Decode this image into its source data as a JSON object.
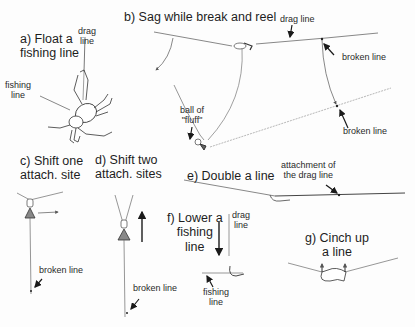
{
  "panels": {
    "a": {
      "title_line1": "a) Float a",
      "title_line2": "fishing line",
      "labels": {
        "drag_line_1": "drag",
        "drag_line_2": "line",
        "fishing_line_1": "fishing",
        "fishing_line_2": "line"
      }
    },
    "b": {
      "title": "b) Sag while break and reel",
      "labels": {
        "drag_line": "drag line",
        "broken_line_upper": "broken line",
        "broken_line_lower": "broken line",
        "ball_of_fluff_1": "ball of",
        "ball_of_fluff_2": "\"fluff\""
      }
    },
    "c": {
      "title_line1": "c) Shift one",
      "title_line2": "attach. site",
      "labels": {
        "broken_line": "broken line"
      }
    },
    "d": {
      "title_line1": "d) Shift two",
      "title_line2": "attach. sites",
      "labels": {
        "broken_line": "broken line"
      }
    },
    "e": {
      "title": "e) Double a line",
      "labels": {
        "attachment_1": "attachment of",
        "attachment_2": "the drag line"
      }
    },
    "f": {
      "title_line1": "f) Lower a",
      "title_line2": "fishing",
      "title_line3": "line",
      "labels": {
        "drag_line_1": "drag",
        "drag_line_2": "line",
        "fishing_line_1": "fishing",
        "fishing_line_2": "line"
      }
    },
    "g": {
      "title_line1": "g) Cinch up",
      "title_line2": "a line"
    }
  },
  "colors": {
    "line": "#6a6a6a",
    "ink": "#1a1a1a",
    "background": "#fdfdfd"
  }
}
